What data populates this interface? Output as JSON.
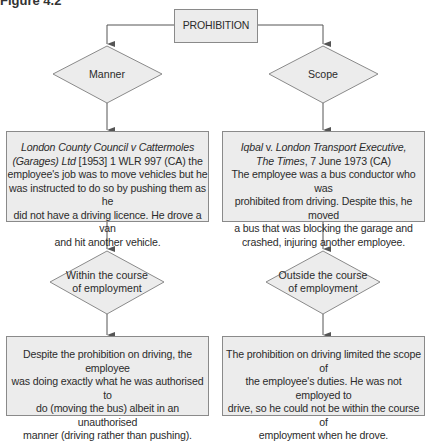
{
  "figure_label": "Figure 4.2",
  "root": {
    "label": "PROHIBITION"
  },
  "branches": [
    {
      "decision": "Manner",
      "case": {
        "citation_italic_1": "London County Council",
        "v": " v ",
        "citation_italic_2": "Cattermoles",
        "citation_italic_3": "(Garages) Ltd",
        "citation_rest": " [1953] 1 WLR 997 (CA) the",
        "lines": [
          "employee's job was to move vehicles but he",
          "was instructed to do so by pushing them as he",
          "did not have a driving licence. He drove a van",
          "and hit another vehicle."
        ]
      },
      "outcome_decision_lines": [
        "Within the course",
        "of employment"
      ],
      "outcome_lines": [
        "Despite the prohibition on driving, the employee",
        "was doing exactly what he was authorised to",
        "do (moving the bus) albeit in an unauthorised",
        "manner (driving rather than pushing)."
      ]
    },
    {
      "decision": "Scope",
      "case": {
        "citation_italic_1": "Iqbal",
        "v": " v. ",
        "citation_italic_2": "London Transport Executive,",
        "citation_italic_3": "The Times",
        "citation_rest": ", 7 June 1973 (CA)",
        "lines": [
          "The employee was a bus conductor who was",
          "prohibited from driving. Despite this, he moved",
          "a bus that was blocking the garage and",
          "crashed, injuring another employee."
        ]
      },
      "outcome_decision_lines": [
        "Outside the course",
        "of employment"
      ],
      "outcome_lines": [
        "The prohibition on driving limited the scope of",
        "the employee's duties. He was not employed to",
        "drive, so he could not be within the course of",
        "employment when he drove."
      ]
    }
  ],
  "colors": {
    "fill": "#ececec",
    "stroke": "#8a8a8a",
    "connector": "#555555"
  }
}
